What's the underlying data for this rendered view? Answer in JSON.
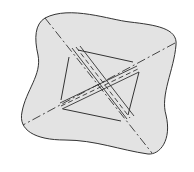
{
  "diagram": {
    "background": "#ffffff",
    "blob_fill": "#e3e3e3",
    "stroke": "#333333",
    "shapes": [
      "outer-blob",
      "inner-quadrilateral",
      "crossing-band-1",
      "crossing-band-2",
      "dashed-axis-1",
      "dashed-axis-2"
    ]
  }
}
